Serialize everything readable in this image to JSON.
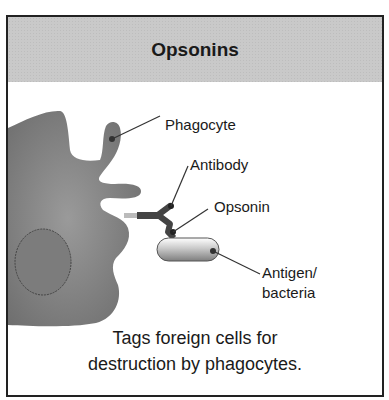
{
  "title": "Opsonins",
  "labels": {
    "phagocyte": "Phagocyte",
    "antibody": "Antibody",
    "opsonin": "Opsonin",
    "antigen_line1": "Antigen/",
    "antigen_line2": "bacteria"
  },
  "caption": {
    "line1": "Tags foreign cells for",
    "line2": "destruction by phagocytes."
  },
  "colors": {
    "header_bg": "#c9c9c9",
    "cell_fill": "#7a7a7a",
    "antibody": "#444444",
    "border": "#222222"
  }
}
